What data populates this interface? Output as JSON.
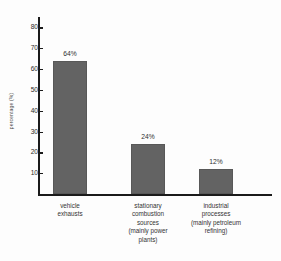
{
  "chart_data": {
    "type": "bar",
    "title": "",
    "subtitle": "",
    "xlabel": "",
    "ylabel": "percentage (%)",
    "ylim": [
      0,
      85
    ],
    "yticks": [
      10,
      20,
      30,
      40,
      50,
      60,
      70,
      80
    ],
    "ytick_labels": [
      "10",
      "20",
      "30",
      "40",
      "50",
      "60",
      "70",
      "80"
    ],
    "grid": false,
    "legend": null,
    "categories": [
      "vehicle exhausts",
      "stationary combustion sources (mainly power plants)",
      "industrial processes (mainly petroleum refining)"
    ],
    "category_lines": [
      [
        "vehicle",
        "exhausts"
      ],
      [
        "stationary",
        "combustion",
        "sources",
        "(mainly power",
        "plants)"
      ],
      [
        "industrial",
        "processes",
        "(mainly petroleum",
        "refining)"
      ]
    ],
    "values": [
      64,
      24,
      12
    ],
    "data_labels": [
      "64%",
      "24%",
      "12%"
    ],
    "colors": {
      "bar_fill": "#636363",
      "bar_edge": "#585858",
      "axis": "#1b1b1b",
      "text": "#2e2e2e",
      "background": "#fdfdfd"
    }
  }
}
